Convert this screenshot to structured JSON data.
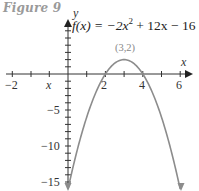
{
  "figure": {
    "title": "Figure 9"
  },
  "chart_data": {
    "type": "line",
    "title": "Figure 9",
    "function_label": "f(x) = −2x² + 12x − 16",
    "function": "-2x^2 + 12x - 16",
    "xlabel": "x",
    "ylabel": "y",
    "xlim": [
      -3,
      6.3
    ],
    "ylim": [
      -16,
      7
    ],
    "x_tick_labels": [
      "−2",
      "x",
      "2",
      "4",
      "6"
    ],
    "x_tick_label_values": [
      -2,
      -1,
      2,
      4,
      6
    ],
    "y_tick_labels": [
      "−5",
      "−10",
      "−15"
    ],
    "y_tick_label_values": [
      -5,
      -10,
      -15
    ],
    "annotations": [
      {
        "text": "(3,2)",
        "x": 3,
        "y": 2,
        "meaning": "vertex"
      }
    ],
    "x_intercepts": [
      2,
      4
    ],
    "vertex": [
      3,
      2
    ],
    "points": [
      {
        "x": 0,
        "y": -16
      },
      {
        "x": 1,
        "y": -6
      },
      {
        "x": 2,
        "y": 0
      },
      {
        "x": 3,
        "y": 2
      },
      {
        "x": 4,
        "y": 0
      },
      {
        "x": 5,
        "y": -6
      },
      {
        "x": 6,
        "y": -16
      }
    ],
    "grid": false,
    "legend": null
  },
  "labels": {
    "equation_prefix": "f(x) = −2x",
    "equation_exp": "2",
    "equation_suffix": " + 12x − 16",
    "y_axis": "y",
    "x_axis": "x",
    "vertex": "(3,2)",
    "tick_neg2": "−2",
    "tick_x": "x",
    "tick_2": "2",
    "tick_4": "4",
    "tick_6": "6",
    "tick_neg5": "−5",
    "tick_neg10": "−10",
    "tick_neg15": "−15"
  }
}
